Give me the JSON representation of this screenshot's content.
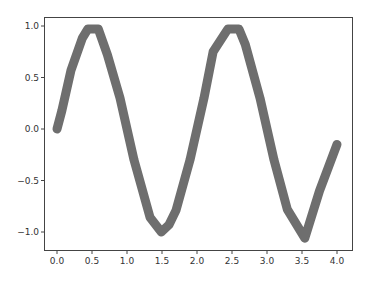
{
  "chart_data": {
    "type": "line",
    "title": "",
    "xlabel": "",
    "ylabel": "",
    "xlim": [
      -0.2,
      4.2
    ],
    "ylim": [
      -1.18,
      1.13
    ],
    "grid": false,
    "legend": null,
    "x_ticks": [
      0.0,
      0.5,
      1.0,
      1.5,
      2.0,
      2.5,
      3.0,
      3.5,
      4.0
    ],
    "x_tick_labels": [
      "0.0",
      "0.5",
      "1.0",
      "1.5",
      "2.0",
      "2.5",
      "3.0",
      "3.5",
      "4.0"
    ],
    "y_ticks": [
      1.0,
      0.5,
      0.0,
      -0.5,
      -1.0
    ],
    "y_tick_labels": [
      "1.0",
      "0.5",
      "0.0",
      "−0.5",
      "−1.0"
    ],
    "series": [
      {
        "name": "line",
        "color": "#6e6e6e",
        "line_width": 9,
        "x": [
          0.0,
          0.07,
          0.2,
          0.36,
          0.44,
          0.59,
          0.72,
          0.9,
          1.1,
          1.33,
          1.49,
          1.6,
          1.7,
          1.9,
          2.1,
          2.23,
          2.44,
          2.6,
          2.69,
          2.9,
          3.1,
          3.29,
          3.54,
          3.75,
          4.0
        ],
        "y": [
          0.0,
          0.18,
          0.57,
          0.88,
          0.97,
          0.97,
          0.72,
          0.3,
          -0.3,
          -0.86,
          -1.0,
          -0.93,
          -0.79,
          -0.3,
          0.3,
          0.75,
          0.97,
          0.97,
          0.82,
          0.3,
          -0.3,
          -0.78,
          -1.06,
          -0.6,
          -0.15
        ]
      }
    ]
  }
}
